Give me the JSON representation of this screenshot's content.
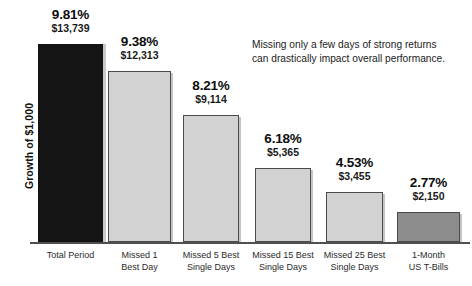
{
  "chart_data": {
    "type": "bar",
    "title": "",
    "subtitle": "",
    "xlabel": "",
    "ylabel": "Growth of $1,000",
    "grid": false,
    "legend": "none",
    "ylim": [
      0,
      14500
    ],
    "annotation": "Missing only a few days of strong returns\ncan drastically impact overall performance.",
    "categories": [
      "Total Period",
      "Missed 1\nBest Day",
      "Missed 5 Best\nSingle Days",
      "Missed 15 Best\nSingle Days",
      "Missed 25 Best\nSingle Days",
      "1-Month\nUS T-Bills"
    ],
    "values": [
      13739,
      12313,
      9114,
      5365,
      3455,
      2150
    ],
    "percent_labels": [
      "9.81%",
      "9.38%",
      "8.21%",
      "6.18%",
      "4.53%",
      "2.77%"
    ],
    "value_labels": [
      "$13,739",
      "$12,313",
      "$9,114",
      "$5,365",
      "$3,455",
      "$2,150"
    ],
    "percents": [
      9.81,
      9.38,
      8.21,
      6.18,
      4.53,
      2.77
    ],
    "bar_colors": [
      "#141414",
      "#d2d2d2",
      "#d2d2d2",
      "#d2d2d2",
      "#d2d2d2",
      "#8c8c8c"
    ],
    "bar_styles": [
      "dark",
      "light",
      "light",
      "light",
      "light",
      "mid"
    ],
    "axis_color": "#4f4f4f",
    "background": "#ffffff",
    "geometry": {
      "baseline_y": 242,
      "bars": [
        {
          "x": 38,
          "width": 65,
          "top": 44
        },
        {
          "x": 108,
          "width": 63,
          "top": 71
        },
        {
          "x": 183,
          "width": 56,
          "top": 115
        },
        {
          "x": 255,
          "width": 56,
          "top": 168
        },
        {
          "x": 326,
          "width": 57,
          "top": 192
        },
        {
          "x": 397,
          "width": 63,
          "top": 212
        }
      ],
      "label_anchors": [
        {
          "cx": 70.5,
          "top": 8
        },
        {
          "cx": 139.5,
          "top": 35
        },
        {
          "cx": 211,
          "top": 79
        },
        {
          "cx": 283,
          "top": 132
        },
        {
          "cx": 354.5,
          "top": 156
        },
        {
          "cx": 428.5,
          "top": 176
        }
      ],
      "category_anchors": [
        {
          "cx": 70.5,
          "width": 100
        },
        {
          "cx": 139.5,
          "width": 100
        },
        {
          "cx": 211,
          "width": 100
        },
        {
          "cx": 283,
          "width": 100
        },
        {
          "cx": 354.5,
          "width": 100
        },
        {
          "cx": 428.5,
          "width": 100
        }
      ]
    }
  }
}
